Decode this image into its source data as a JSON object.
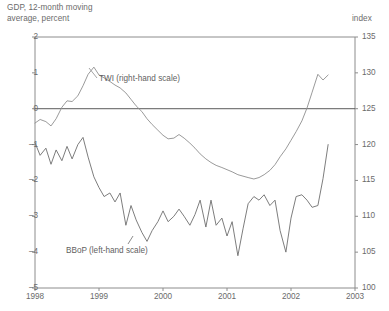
{
  "titles": {
    "left": "GDP, 12-month moving\naverage, percent",
    "right": "index"
  },
  "series_labels": {
    "twi": "TWI (right-hand scale)",
    "bbop": "BBoP (left-hand scale)"
  },
  "colors": {
    "axis": "#8c8c8c",
    "text": "#6b6b6b",
    "twi_line": "#8e8e8e",
    "bbop_line": "#6e6e6e",
    "zero_line": "#5b5b5b"
  },
  "chart_data": {
    "type": "line",
    "title": "GDP, 12-month moving average, percent",
    "xlabel": "",
    "ylabel": "GDP, 12-month moving average, percent",
    "y2label": "index",
    "grid": false,
    "legend": "inline-annotations",
    "xlim": [
      1998,
      2003
    ],
    "ylim": [
      -5,
      2
    ],
    "y2lim": [
      100,
      135
    ],
    "xticks": [
      "1998",
      "1999",
      "2000",
      "2001",
      "2002",
      "2003"
    ],
    "yticks": [
      "2",
      "1",
      "0",
      "-1",
      "-2",
      "-3",
      "-4",
      "-5"
    ],
    "y2ticks": [
      "135",
      "130",
      "125",
      "120",
      "115",
      "110",
      "105",
      "100"
    ],
    "zero_reference_line": 0,
    "series": [
      {
        "name": "TWI (right-hand scale)",
        "axis": "right",
        "units": "index",
        "x": [
          1998.0,
          1998.08,
          1998.17,
          1998.25,
          1998.33,
          1998.42,
          1998.5,
          1998.58,
          1998.67,
          1998.75,
          1998.83,
          1998.92,
          1999.0,
          1999.08,
          1999.17,
          1999.25,
          1999.33,
          1999.42,
          1999.5,
          1999.58,
          1999.67,
          1999.75,
          1999.83,
          1999.92,
          2000.0,
          2000.08,
          2000.17,
          2000.25,
          2000.33,
          2000.42,
          2000.5,
          2000.58,
          2000.67,
          2000.75,
          2000.83,
          2000.92,
          2001.0,
          2001.08,
          2001.17,
          2001.25,
          2001.33,
          2001.42,
          2001.5,
          2001.58,
          2001.67,
          2001.75,
          2001.83,
          2001.92,
          2002.0,
          2002.08,
          2002.17,
          2002.25,
          2002.33,
          2002.42,
          2002.5,
          2002.58
        ],
        "values": [
          123.0,
          123.5,
          123.2,
          122.6,
          123.6,
          125.2,
          126.1,
          126.0,
          126.8,
          128.2,
          129.8,
          130.8,
          129.7,
          129.3,
          128.8,
          128.3,
          127.9,
          127.2,
          126.3,
          125.4,
          124.6,
          123.6,
          122.8,
          122.0,
          121.3,
          120.8,
          120.9,
          121.4,
          120.9,
          120.2,
          119.5,
          118.7,
          118.0,
          117.5,
          117.1,
          116.8,
          116.5,
          116.2,
          115.8,
          115.6,
          115.4,
          115.2,
          115.4,
          115.8,
          116.4,
          117.2,
          118.3,
          119.4,
          120.6,
          121.8,
          123.3,
          125.1,
          127.3,
          129.8,
          129.0,
          129.7
        ]
      },
      {
        "name": "BBoP (left-hand scale)",
        "axis": "left",
        "units": "percent",
        "x": [
          1998.0,
          1998.08,
          1998.17,
          1998.25,
          1998.33,
          1998.42,
          1998.5,
          1998.58,
          1998.67,
          1998.75,
          1998.83,
          1998.92,
          1999.0,
          1999.08,
          1999.17,
          1999.25,
          1999.33,
          1999.42,
          1999.5,
          1999.58,
          1999.67,
          1999.75,
          1999.83,
          1999.92,
          2000.0,
          2000.08,
          2000.17,
          2000.25,
          2000.33,
          2000.42,
          2000.5,
          2000.58,
          2000.67,
          2000.75,
          2000.83,
          2000.92,
          2001.0,
          2001.08,
          2001.17,
          2001.25,
          2001.33,
          2001.42,
          2001.5,
          2001.58,
          2001.67,
          2001.75,
          2001.83,
          2001.92,
          2002.0,
          2002.08,
          2002.17,
          2002.25,
          2002.33,
          2002.42,
          2002.5,
          2002.58
        ],
        "values": [
          -0.95,
          -1.3,
          -1.1,
          -1.55,
          -1.15,
          -1.45,
          -1.05,
          -1.4,
          -1.0,
          -0.8,
          -1.35,
          -1.9,
          -2.2,
          -2.45,
          -2.35,
          -2.6,
          -2.35,
          -3.25,
          -2.7,
          -3.1,
          -3.45,
          -3.7,
          -3.4,
          -3.15,
          -2.85,
          -3.15,
          -3.0,
          -2.8,
          -3.0,
          -3.25,
          -2.95,
          -2.55,
          -3.3,
          -2.55,
          -3.25,
          -3.05,
          -3.55,
          -3.15,
          -4.1,
          -3.35,
          -2.65,
          -2.45,
          -2.55,
          -2.4,
          -2.7,
          -2.55,
          -3.4,
          -4.0,
          -3.05,
          -2.45,
          -2.4,
          -2.55,
          -2.75,
          -2.7,
          -1.95,
          -1.0
        ]
      }
    ]
  }
}
